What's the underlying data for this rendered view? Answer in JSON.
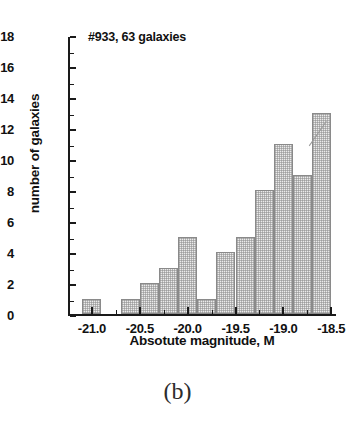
{
  "figure": {
    "panel_caption": "(b)",
    "annotation": "#933, 63 galaxies"
  },
  "chart_data": {
    "type": "bar",
    "title": "#933, 63 galaxies",
    "xlabel": "Absotute magnitude, M",
    "ylabel": "number of galaxies",
    "xlim": [
      -21.25,
      -18.45
    ],
    "ylim": [
      0,
      18
    ],
    "grid": false,
    "legend": null,
    "bin_width": 0.2,
    "xticks": [
      "-21.0",
      "-20.5",
      "-20.0",
      "-19.5",
      "-19.0",
      "-18.5"
    ],
    "xtick_values": [
      -21.0,
      -20.5,
      -20.0,
      -19.5,
      -19.0,
      -18.5
    ],
    "yticks": [
      "0",
      "2",
      "4",
      "6",
      "8",
      "10",
      "12",
      "14",
      "16",
      "18"
    ],
    "ytick_values": [
      0,
      2,
      4,
      6,
      8,
      10,
      12,
      14,
      16,
      18
    ],
    "bins": [
      {
        "left": -21.1,
        "right": -20.9,
        "value": 1
      },
      {
        "left": -20.9,
        "right": -20.7,
        "value": 0
      },
      {
        "left": -20.7,
        "right": -20.5,
        "value": 1
      },
      {
        "left": -20.5,
        "right": -20.3,
        "value": 2
      },
      {
        "left": -20.3,
        "right": -20.1,
        "value": 3
      },
      {
        "left": -20.1,
        "right": -19.9,
        "value": 5
      },
      {
        "left": -19.9,
        "right": -19.7,
        "value": 1
      },
      {
        "left": -19.7,
        "right": -19.5,
        "value": 4
      },
      {
        "left": -19.5,
        "right": -19.3,
        "value": 5
      },
      {
        "left": -19.3,
        "right": -19.1,
        "value": 8
      },
      {
        "left": -19.1,
        "right": -18.9,
        "value": 11
      },
      {
        "left": -18.9,
        "right": -18.7,
        "value": 9
      },
      {
        "left": -18.7,
        "right": -18.5,
        "value": 13
      }
    ],
    "values": [
      1,
      0,
      1,
      2,
      3,
      5,
      1,
      4,
      5,
      8,
      11,
      9,
      13
    ],
    "total_count": 63,
    "colors": {
      "bar_fill": "#ebebeb",
      "bar_edge": "#8a8a8a",
      "axis": "#1a1a1a",
      "text": "#111111",
      "background": "#ffffff"
    }
  }
}
